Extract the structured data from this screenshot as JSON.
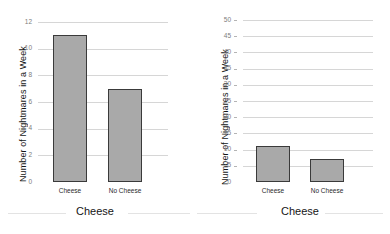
{
  "chart_data": [
    {
      "type": "bar",
      "panel": "left",
      "title": "",
      "categories": [
        "Cheese",
        "No Cheese"
      ],
      "values": [
        11,
        7
      ],
      "xlabel": "Cheese",
      "ylabel": "Number of Nightmares in a Week",
      "ylim": [
        0,
        12
      ],
      "yticks": [
        0,
        2,
        4,
        6,
        8,
        10,
        12
      ],
      "ytick_labels": [
        "0",
        "2",
        "4",
        "6",
        "8",
        "10",
        "12"
      ],
      "grid": true,
      "legend": "none",
      "bar_fill": "#a9a9a9",
      "bar_edge": "#3a3a3a"
    },
    {
      "type": "bar",
      "panel": "right",
      "title": "",
      "categories": [
        "Cheese",
        "No Cheese"
      ],
      "values": [
        11,
        7
      ],
      "xlabel": "Cheese",
      "ylabel": "Number of Nightmares in a Week",
      "ylim": [
        0,
        50
      ],
      "yticks": [
        0,
        5,
        10,
        15,
        20,
        25,
        30,
        35,
        40,
        45,
        50
      ],
      "ytick_labels": [
        "0",
        "5",
        "10",
        "15",
        "20",
        "25",
        "30",
        "35",
        "40",
        "45",
        "50"
      ],
      "grid": true,
      "legend": "none",
      "bar_fill": "#a9a9a9",
      "bar_edge": "#3a3a3a"
    }
  ],
  "left_chart": {
    "ylabel": "Number of Nightmares in a Week",
    "xlabel": "Cheese",
    "yticks": [
      "12",
      "10",
      "8",
      "6",
      "4",
      "2",
      "0"
    ],
    "categories": [
      "Cheese",
      "No Cheese"
    ]
  },
  "right_chart": {
    "ylabel": "Number of Nightmares in a Week",
    "xlabel": "Cheese",
    "yticks": [
      "50",
      "45",
      "40",
      "35",
      "30",
      "25",
      "20",
      "15",
      "10",
      "5",
      "0"
    ],
    "categories": [
      "Cheese",
      "No Cheese"
    ]
  }
}
